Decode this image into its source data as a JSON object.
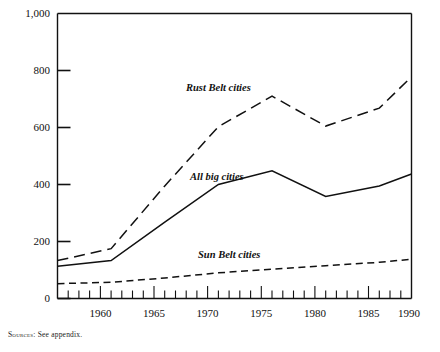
{
  "chart_data": {
    "type": "line",
    "title": "",
    "xlabel": "",
    "ylabel": "",
    "xlim": [
      1957,
      1990
    ],
    "ylim": [
      0,
      1000
    ],
    "grid": false,
    "legend_position": "inline-annotations",
    "ytick_labels": [
      "0",
      "200",
      "400",
      "600",
      "800",
      "1,000"
    ],
    "ytick_values": [
      0,
      200,
      400,
      600,
      800,
      1000
    ],
    "xtick_labels": [
      "1960",
      "1965",
      "1970",
      "1975",
      "1980",
      "1985",
      "1990"
    ],
    "xtick_values": [
      1960,
      1965,
      1970,
      1975,
      1980,
      1985,
      1990
    ],
    "minor_xticks": "annual",
    "series": [
      {
        "name": "Rust Belt cities",
        "style": "long-dash",
        "x": [
          1957,
          1962,
          1967,
          1972,
          1977,
          1982,
          1987,
          1990
        ],
        "values": [
          133,
          175,
          395,
          603,
          710,
          605,
          668,
          778
        ]
      },
      {
        "name": "All big cities",
        "style": "solid",
        "x": [
          1957,
          1962,
          1967,
          1972,
          1977,
          1982,
          1987,
          1990
        ],
        "values": [
          113,
          133,
          268,
          400,
          448,
          358,
          395,
          437
        ]
      },
      {
        "name": "Sun Belt cities",
        "style": "short-dash",
        "x": [
          1957,
          1962,
          1967,
          1972,
          1977,
          1982,
          1987,
          1990
        ],
        "values": [
          52,
          57,
          72,
          90,
          103,
          115,
          127,
          138
        ]
      }
    ],
    "annotations": [
      {
        "text": "Rust Belt cities",
        "x": 1975,
        "y": 832
      },
      {
        "text": "All big cities",
        "x": 1974,
        "y": 518
      },
      {
        "text": "Sun Belt cities",
        "x": 1977,
        "y": 243
      }
    ]
  },
  "footer": {
    "source_prefix": "Sources:",
    "source_text": "See appendix."
  }
}
